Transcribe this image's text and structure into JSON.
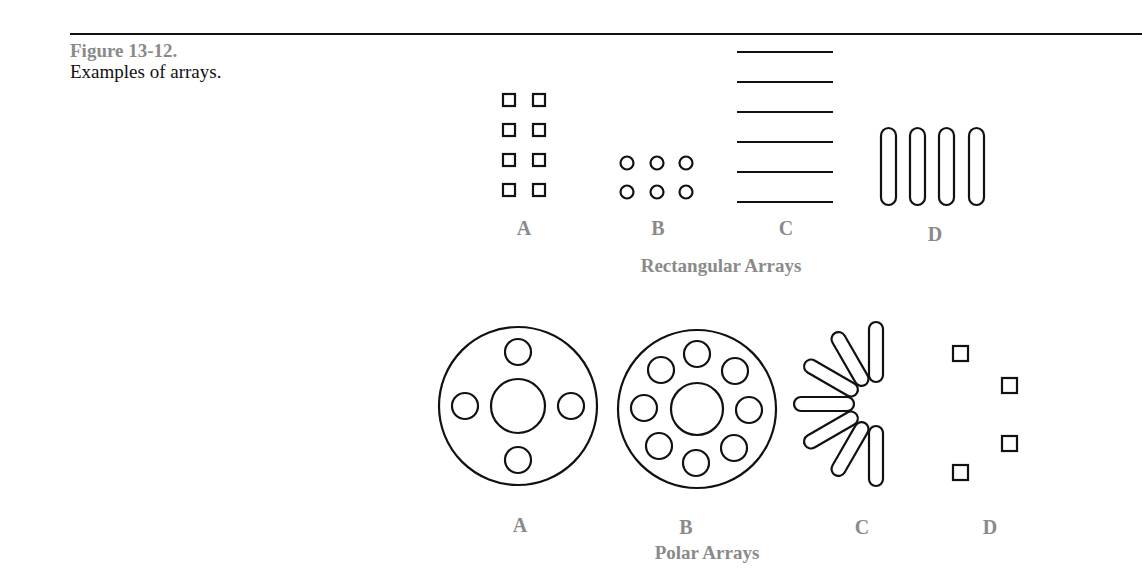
{
  "figure": {
    "number": "Figure 13-12.",
    "caption": "Examples of arrays."
  },
  "rectangular": {
    "title": "Rectangular Arrays",
    "items": [
      {
        "label": "A",
        "description": "4 rows x 2 columns of small squares"
      },
      {
        "label": "B",
        "description": "2 rows x 3 columns of small circles"
      },
      {
        "label": "C",
        "description": "6 stacked horizontal lines"
      },
      {
        "label": "D",
        "description": "4 vertical slots in a row"
      }
    ]
  },
  "polar": {
    "title": "Polar Arrays",
    "items": [
      {
        "label": "A",
        "description": "Circle with center hole and 4 holes"
      },
      {
        "label": "B",
        "description": "Circle with center hole and 8 holes"
      },
      {
        "label": "C",
        "description": "7 slots arrayed over 180 degrees"
      },
      {
        "label": "D",
        "description": "4 squares arrayed on an arc"
      }
    ]
  }
}
